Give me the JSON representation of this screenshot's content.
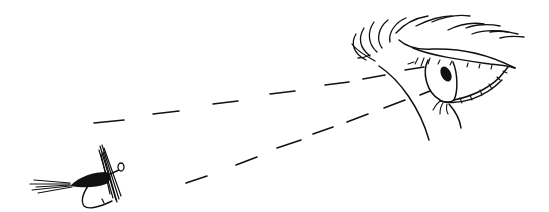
{
  "illustration": {
    "title": "Eye looking at a fishing fly",
    "background_color": "#ffffff",
    "ink_color": "#111111",
    "elements": [
      "eye",
      "eyebrow",
      "sight-line-upper",
      "sight-line-lower",
      "fishing-fly"
    ]
  }
}
